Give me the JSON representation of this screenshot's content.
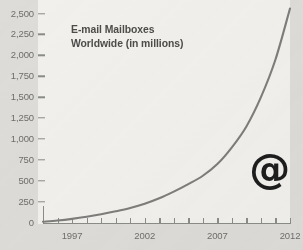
{
  "chart_data": {
    "type": "line",
    "title": "E-mail Mailboxes Worldwide (in millions)",
    "title_lines": [
      "E-mail Mailboxes",
      "Worldwide (in millions)"
    ],
    "xlabel": "",
    "ylabel": "",
    "ylim": [
      0,
      2500
    ],
    "xlim": [
      1995,
      2012
    ],
    "grid": false,
    "legend": false,
    "y_ticks": [
      0,
      250,
      500,
      750,
      1000,
      1250,
      1500,
      1750,
      2000,
      2250,
      2500
    ],
    "y_tick_labels": [
      "0",
      "250",
      "500",
      "750",
      "1,000",
      "1,250",
      "1,500",
      "1,750",
      "2,000",
      "2,250",
      "2,500"
    ],
    "x_ticks": [
      1995,
      1996,
      1997,
      1998,
      1999,
      2000,
      2001,
      2002,
      2003,
      2004,
      2005,
      2006,
      2007,
      2008,
      2009,
      2010,
      2011,
      2012
    ],
    "x_tick_labels_shown": [
      "1997",
      "2002",
      "2007",
      "2012"
    ],
    "x_labeled_ticks": [
      1997,
      2002,
      2007,
      2012
    ],
    "series": [
      {
        "name": "E-mail Mailboxes Worldwide",
        "color": "#7d7d7b",
        "x": [
          1995,
          1996,
          1997,
          1998,
          1999,
          2000,
          2001,
          2002,
          2003,
          2004,
          2005,
          2006,
          2007,
          2008,
          2009,
          2010,
          2011,
          2012
        ],
        "values": [
          10,
          25,
          45,
          70,
          100,
          135,
          175,
          225,
          290,
          370,
          460,
          560,
          700,
          900,
          1150,
          1500,
          1950,
          2560
        ]
      }
    ],
    "annotations": [
      {
        "name": "at-symbol",
        "text": "@",
        "x": 2010.5,
        "y": 640
      }
    ],
    "colors": {
      "plot_background": "#f2f0ec",
      "page_background": "#dedcd8",
      "axis": "#8b8b87",
      "tick_label": "#6e6e6c",
      "title": "#4c4c4a",
      "line": "#7d7d7b",
      "annotation": "#1d1d1d"
    }
  }
}
